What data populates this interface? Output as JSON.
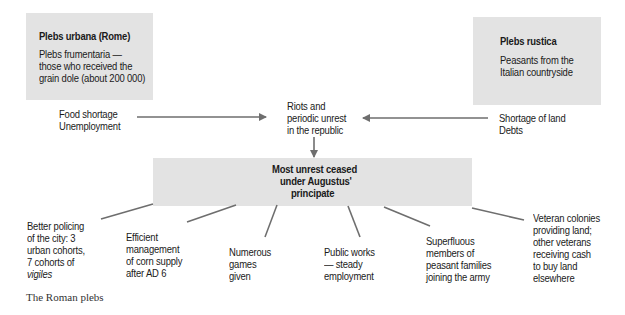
{
  "diagram": {
    "plebs_urbana": {
      "title": "Plebs urbana (Rome)",
      "desc": [
        "Plebs frumentaria —",
        "those who received the",
        "grain dole (about 200 000)"
      ],
      "causes": [
        "Food shortage",
        "Unemployment"
      ]
    },
    "plebs_rustica": {
      "title": "Plebs rustica",
      "desc": [
        "Peasants from the",
        "Italian countryside"
      ],
      "causes": [
        "Shortage of land",
        "Debts"
      ]
    },
    "center": {
      "lines": [
        "Riots and",
        "periodic unrest",
        "in the republic"
      ]
    },
    "result": {
      "lines": [
        "Most unrest ceased",
        "under Augustus'",
        "principate"
      ]
    },
    "measures": [
      {
        "lines": [
          "Better policing",
          "of the city: 3",
          "urban cohorts,",
          "7 cohorts of"
        ],
        "italic": "vigiles"
      },
      {
        "lines": [
          "Efficient",
          "management",
          "of corn supply",
          "after AD 6"
        ]
      },
      {
        "lines": [
          "Numerous",
          "games",
          "given"
        ]
      },
      {
        "lines": [
          "Public works",
          "— steady",
          "employment"
        ]
      },
      {
        "lines": [
          "Superfluous",
          "members of",
          "peasant families",
          "joining the army"
        ]
      },
      {
        "lines": [
          "Veteran colonies",
          "providing land;",
          "other veterans",
          "receiving cash",
          "to buy land",
          "elsewhere"
        ]
      }
    ]
  },
  "caption": "The Roman plebs",
  "colors": {
    "box_fill": "#e3e3e3",
    "line": "#6e6e6e",
    "text": "#1a1a1a"
  }
}
